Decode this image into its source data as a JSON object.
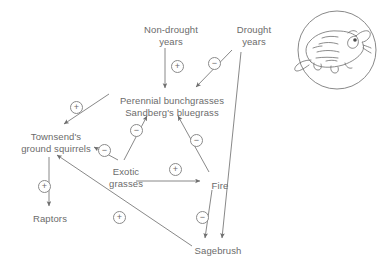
{
  "figure": {
    "background_color": "#ffffff",
    "ink_color": "#6b6b6b",
    "line_color": "#7a7a7a"
  },
  "nodes": [
    {
      "id": "non-drought-years",
      "lines": [
        "Non-drought",
        "years"
      ],
      "x": 131,
      "y": 24,
      "width": 80
    },
    {
      "id": "drought-years",
      "lines": [
        "Drought",
        "years"
      ],
      "x": 228,
      "y": 24,
      "width": 52
    },
    {
      "id": "perennial-bunchgrasses",
      "lines": [
        "Perennial bunchgrasses",
        "Sandberg's bluegrass"
      ],
      "x": 108,
      "y": 95,
      "width": 128
    },
    {
      "id": "townsends-ground-squirrels",
      "lines": [
        "Townsend's",
        "ground squirrels"
      ],
      "x": 14,
      "y": 131,
      "width": 84
    },
    {
      "id": "exotic-grasses",
      "lines": [
        "Exotic",
        "grasses"
      ],
      "x": 104,
      "y": 166,
      "width": 44
    },
    {
      "id": "fire",
      "lines": [
        "Fire"
      ],
      "x": 207,
      "y": 180,
      "width": 26
    },
    {
      "id": "raptors",
      "lines": [
        "Raptors"
      ],
      "x": 28,
      "y": 213,
      "width": 44
    },
    {
      "id": "sagebrush",
      "lines": [
        "Sagebrush"
      ],
      "x": 190,
      "y": 245,
      "width": 56
    }
  ],
  "edges": [
    {
      "id": "non-drought-to-perennial",
      "from": "non-drought-years",
      "to": "perennial-bunchgrasses",
      "sign": "+",
      "sign_x": 171,
      "sign_y": 60
    },
    {
      "id": "drought-to-perennial",
      "from": "drought-years",
      "to": "perennial-bunchgrasses",
      "sign": "−",
      "sign_x": 208,
      "sign_y": 57
    },
    {
      "id": "drought-to-sagebrush",
      "from": "drought-years",
      "to": "sagebrush",
      "sign": "",
      "sign_x": 0,
      "sign_y": 0
    },
    {
      "id": "perennial-to-squirrels",
      "from": "perennial-bunchgrasses",
      "to": "townsends-ground-squirrels",
      "sign": "+",
      "sign_x": 70,
      "sign_y": 101
    },
    {
      "id": "exotic-to-squirrels",
      "from": "exotic-grasses",
      "to": "townsends-ground-squirrels",
      "sign": "−",
      "sign_x": 98,
      "sign_y": 144
    },
    {
      "id": "exotic-to-perennial",
      "from": "exotic-grasses",
      "to": "perennial-bunchgrasses",
      "sign": "−",
      "sign_x": 130,
      "sign_y": 124
    },
    {
      "id": "fire-to-perennial",
      "from": "fire",
      "to": "perennial-bunchgrasses",
      "sign": "−",
      "sign_x": 190,
      "sign_y": 134
    },
    {
      "id": "exotic-to-fire",
      "from": "exotic-grasses",
      "to": "fire",
      "sign": "+",
      "sign_x": 169,
      "sign_y": 163
    },
    {
      "id": "fire-to-sagebrush",
      "from": "fire",
      "to": "sagebrush",
      "sign": "−",
      "sign_x": 196,
      "sign_y": 211
    },
    {
      "id": "sagebrush-to-squirrels",
      "from": "sagebrush",
      "to": "townsends-ground-squirrels",
      "sign": "+",
      "sign_x": 113,
      "sign_y": 211
    },
    {
      "id": "squirrels-to-raptors",
      "from": "townsends-ground-squirrels",
      "to": "raptors",
      "sign": "+",
      "sign_x": 38,
      "sign_y": 180
    }
  ],
  "illustration": {
    "id": "ground-squirrel-illustration",
    "subject": "ground squirrel",
    "shape": "circle",
    "center_x": 337,
    "center_y": 50,
    "radius": 39
  }
}
